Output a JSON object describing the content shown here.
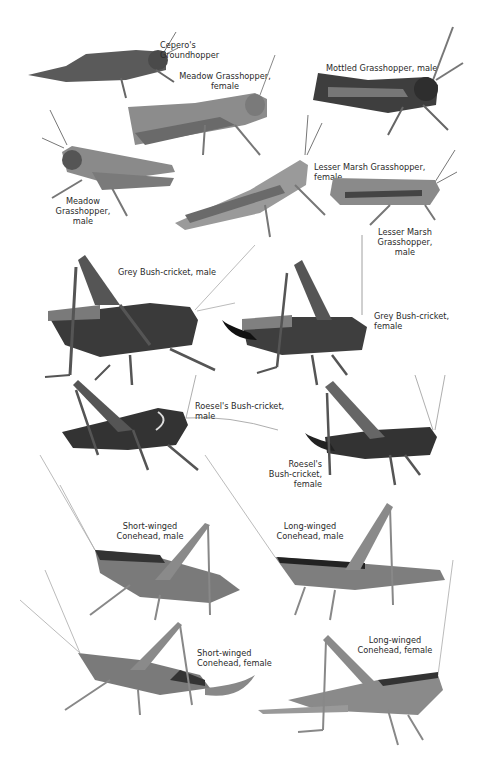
{
  "page": {
    "header_faint_text": [
      "",
      ""
    ],
    "species": [
      {
        "id": "ceperos-groundhopper",
        "label_lines": [
          "Cepero's",
          "Groundhopper"
        ],
        "align": "left"
      },
      {
        "id": "meadow-grasshopper-female",
        "label_lines": [
          "Meadow Grasshopper,",
          "female"
        ],
        "align": "center"
      },
      {
        "id": "mottled-grasshopper-male",
        "label_lines": [
          "Mottled Grasshopper, male"
        ],
        "align": "left"
      },
      {
        "id": "meadow-grasshopper-male",
        "label_lines": [
          "Meadow",
          "Grasshopper,",
          "male"
        ],
        "align": "center"
      },
      {
        "id": "lesser-marsh-grasshopper-female",
        "label_lines": [
          "Lesser Marsh Grasshopper,",
          "female"
        ],
        "align": "left"
      },
      {
        "id": "lesser-marsh-grasshopper-male",
        "label_lines": [
          "Lesser Marsh",
          "Grasshopper,",
          "male"
        ],
        "align": "center"
      },
      {
        "id": "grey-bush-cricket-male",
        "label_lines": [
          "Grey Bush-cricket, male"
        ],
        "align": "left"
      },
      {
        "id": "grey-bush-cricket-female",
        "label_lines": [
          "Grey Bush-cricket,",
          "female"
        ],
        "align": "left"
      },
      {
        "id": "roesels-bush-cricket-male",
        "label_lines": [
          "Roesel's Bush-cricket,",
          "male"
        ],
        "align": "left"
      },
      {
        "id": "roesels-bush-cricket-female",
        "label_lines": [
          "Roesel's",
          "Bush-cricket,",
          "female"
        ],
        "align": "right"
      },
      {
        "id": "short-winged-conehead-male",
        "label_lines": [
          "Short-winged",
          "Conehead, male"
        ],
        "align": "center"
      },
      {
        "id": "long-winged-conehead-male",
        "label_lines": [
          "Long-winged",
          "Conehead, male"
        ],
        "align": "center"
      },
      {
        "id": "short-winged-conehead-female",
        "label_lines": [
          "Short-winged",
          "Conehead, female"
        ],
        "align": "left"
      },
      {
        "id": "long-winged-conehead-female",
        "label_lines": [
          "Long-winged",
          "Conehead, female"
        ],
        "align": "center"
      }
    ]
  },
  "colors": {
    "background": "#ffffff",
    "label_text": "#2a2a2a",
    "insect_dark": "#3a3a3a",
    "insect_mid": "#7a7a7a",
    "insect_light": "#a8a8a8"
  }
}
